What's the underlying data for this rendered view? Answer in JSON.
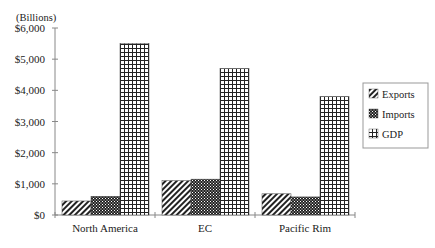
{
  "chart_data": {
    "type": "bar",
    "title": "",
    "unit_label": "(Billions)",
    "xlabel": "",
    "ylabel": "",
    "ylim": [
      0,
      6000
    ],
    "y_ticks": [
      "$0",
      "$1,000",
      "$2,000",
      "$3,000",
      "$4,000",
      "$5,000",
      "$6,000"
    ],
    "y_tick_values": [
      0,
      1000,
      2000,
      3000,
      4000,
      5000,
      6000
    ],
    "categories": [
      "North America",
      "EC",
      "Pacific Rim"
    ],
    "series": [
      {
        "name": "Exports",
        "pattern": "diagonal-hatch",
        "values": [
          450,
          1100,
          680
        ]
      },
      {
        "name": "Imports",
        "pattern": "dense-crosshatch",
        "values": [
          600,
          1150,
          580
        ]
      },
      {
        "name": "GDP",
        "pattern": "grid",
        "values": [
          5500,
          4700,
          3800
        ]
      }
    ],
    "grid": false,
    "legend_position": "right"
  },
  "colors": {
    "ink": "#222222",
    "axis": "#888888",
    "background": "#ffffff"
  }
}
